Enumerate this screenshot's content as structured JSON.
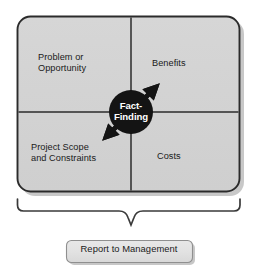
{
  "diagram": {
    "center": {
      "label": "Fact-\nFinding",
      "shape": "circle",
      "fill_color": "#141414",
      "text_color": "#ffffff",
      "arrow_count": 4,
      "arrow_directions": [
        "up-left",
        "up-right",
        "down-left",
        "down-right"
      ]
    },
    "matrix": {
      "fill_color": "#d2d2d2",
      "border_color": "#2b2b2b",
      "quadrants": [
        {
          "position": "top-left",
          "label": "Problem or\nOpportunity"
        },
        {
          "position": "top-right",
          "label": "Benefits"
        },
        {
          "position": "bottom-left",
          "label": "Project Scope\nand Constraints"
        },
        {
          "position": "bottom-right",
          "label": "Costs"
        }
      ]
    },
    "brace": {
      "orientation": "down",
      "color": "#3a3a3a"
    },
    "output_box": {
      "label": "Report to Management",
      "fill_color": "#e0e0e0",
      "border_color": "#8f8f8f",
      "text_color": "#1a1a1a"
    }
  }
}
